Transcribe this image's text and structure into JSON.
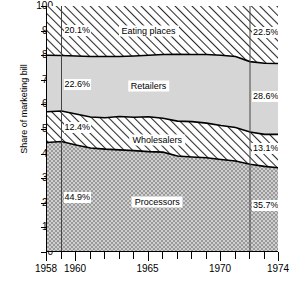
{
  "chart_data": {
    "type": "area",
    "stacked": true,
    "title": "",
    "subtitle": "",
    "xlabel": "",
    "ylabel": "Share of marketing bill",
    "xlim": [
      1958,
      1974
    ],
    "ylim": [
      0,
      100
    ],
    "grid": false,
    "legend_position": "inline-labels",
    "x_ticks_major": [
      1958,
      1960,
      1965,
      1970,
      1974
    ],
    "x_tick_labels": [
      "1958",
      "1960",
      "1965",
      "1970",
      "1974"
    ],
    "x_ticks_all": [
      1958,
      1959,
      1960,
      1961,
      1962,
      1963,
      1964,
      1965,
      1966,
      1967,
      1968,
      1969,
      1970,
      1971,
      1972,
      1973,
      1974
    ],
    "y_ticks": [
      0,
      10,
      20,
      30,
      40,
      50,
      60,
      70,
      80,
      90,
      100
    ],
    "y_tick_labels": [
      "0",
      "10",
      "20",
      "30",
      "40",
      "50",
      "60",
      "70",
      "80",
      "90",
      "100"
    ],
    "reference_lines": [
      {
        "x": 1959,
        "label": "start-year-marker"
      },
      {
        "x": 1972,
        "label": "end-year-marker"
      }
    ],
    "x": [
      1958,
      1959,
      1960,
      1961,
      1962,
      1963,
      1964,
      1965,
      1966,
      1967,
      1968,
      1969,
      1970,
      1971,
      1972,
      1973,
      1974
    ],
    "series": [
      {
        "name": "Processors",
        "pattern": "checker-gray",
        "values": [
          44.5,
          44.9,
          43.5,
          42.3,
          41.8,
          41.5,
          41.2,
          40.8,
          40.6,
          39.0,
          38.6,
          38.3,
          37.6,
          37.0,
          35.7,
          34.8,
          34.2
        ]
      },
      {
        "name": "Wholesalers",
        "pattern": "diagonal-hatch",
        "values": [
          12.5,
          12.4,
          12.6,
          12.6,
          12.8,
          13.6,
          13.6,
          14.2,
          13.8,
          14.2,
          14.4,
          14.1,
          13.8,
          13.6,
          13.1,
          13.0,
          13.6
        ]
      },
      {
        "name": "Retailers",
        "pattern": "solid-light-gray",
        "values": [
          23.0,
          22.6,
          23.6,
          24.6,
          24.9,
          24.4,
          24.9,
          25.0,
          25.9,
          27.2,
          27.3,
          27.9,
          28.6,
          28.9,
          28.6,
          28.9,
          28.8
        ]
      },
      {
        "name": "Eating places",
        "pattern": "diagonal-hatch",
        "values": [
          20.0,
          20.1,
          20.3,
          20.5,
          20.5,
          20.5,
          20.3,
          20.0,
          19.7,
          19.6,
          19.7,
          19.7,
          20.0,
          20.5,
          22.6,
          23.3,
          23.4
        ]
      }
    ],
    "cumulative_top_edges": {
      "processors_top": [
        44.5,
        44.9,
        43.5,
        42.3,
        41.8,
        41.5,
        41.2,
        40.8,
        40.6,
        39.0,
        38.6,
        38.3,
        37.6,
        37.0,
        35.7,
        34.8,
        34.2
      ],
      "wholesalers_top": [
        57.0,
        57.3,
        56.1,
        54.9,
        54.6,
        55.1,
        54.8,
        55.0,
        54.4,
        53.2,
        53.0,
        52.4,
        51.4,
        50.6,
        48.8,
        47.8,
        47.8
      ],
      "retailers_top": [
        80.0,
        79.9,
        79.7,
        79.5,
        79.5,
        79.5,
        79.7,
        80.0,
        80.3,
        80.4,
        80.3,
        80.3,
        80.0,
        79.5,
        77.4,
        76.7,
        76.6
      ],
      "eating_top": [
        100,
        100,
        100,
        100,
        100,
        100,
        100,
        100,
        100,
        100,
        100,
        100,
        100,
        100,
        100,
        100,
        100
      ]
    },
    "annotations": [
      {
        "name": "eating-places-1959-pct",
        "text": "20.1%",
        "x": 1959,
        "y": 89.9
      },
      {
        "name": "retailers-1959-pct",
        "text": "22.6%",
        "x": 1959,
        "y": 68.0
      },
      {
        "name": "wholesalers-1959-pct",
        "text": "12.4%",
        "x": 1959,
        "y": 50.5
      },
      {
        "name": "processors-1959-pct",
        "text": "44.9%",
        "x": 1959,
        "y": 22.0
      },
      {
        "name": "eating-places-1972-pct",
        "text": "22.5%",
        "x": 1972,
        "y": 89.0
      },
      {
        "name": "retailers-1972-pct",
        "text": "28.6%",
        "x": 1972,
        "y": 63.0
      },
      {
        "name": "wholesalers-1972-pct",
        "text": "13.1%",
        "x": 1972,
        "y": 42.0
      },
      {
        "name": "processors-1972-pct",
        "text": "35.7%",
        "x": 1972,
        "y": 18.5
      }
    ],
    "band_labels": [
      {
        "name": "eating-places-band-label",
        "text": "Eating places",
        "x": 1965.0,
        "y": 90.0
      },
      {
        "name": "retailers-band-label",
        "text": "Retailers",
        "x": 1965.0,
        "y": 67.5
      },
      {
        "name": "wholesalers-band-label",
        "text": "Wholesalers",
        "x": 1965.6,
        "y": 45.5
      },
      {
        "name": "processors-band-label",
        "text": "Processors",
        "x": 1965.6,
        "y": 20.5
      }
    ],
    "colors": {
      "axis": "#000000",
      "outline": "#000000",
      "retailers_fill": "#d6d6d6",
      "processors_fill": "#b8b8b8",
      "hatch_fill": "#ffffff",
      "hatch_stroke": "#2b2b2b",
      "background": "#ffffff"
    }
  }
}
